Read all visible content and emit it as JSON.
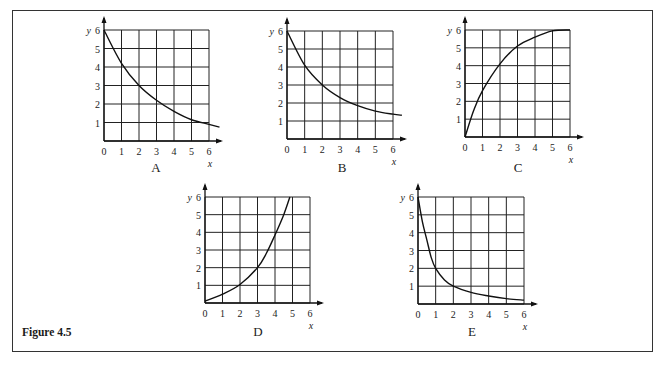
{
  "figure": {
    "caption": "Figure 4.5"
  },
  "chart_data": [
    {
      "type": "line",
      "panel_label": "A",
      "xlabel": "x",
      "ylabel": "y",
      "xlim": [
        0,
        6
      ],
      "ylim": [
        0,
        6
      ],
      "grid": true,
      "x_ticks": [
        "0",
        "1",
        "2",
        "3",
        "4",
        "5",
        "6"
      ],
      "y_ticks": [
        "1",
        "2",
        "3",
        "4",
        "5",
        "6"
      ],
      "x": [
        0,
        1,
        2,
        3,
        4,
        5,
        6,
        6.6
      ],
      "values": [
        6,
        4.2,
        3.0,
        2.2,
        1.6,
        1.15,
        0.9,
        0.75
      ]
    },
    {
      "type": "line",
      "panel_label": "B",
      "xlabel": "x",
      "ylabel": "y",
      "xlim": [
        0,
        6
      ],
      "ylim": [
        0,
        6
      ],
      "grid": true,
      "x_ticks": [
        "0",
        "1",
        "2",
        "3",
        "4",
        "5",
        "6"
      ],
      "y_ticks": [
        "1",
        "2",
        "3",
        "4",
        "5",
        "6"
      ],
      "x": [
        0,
        1,
        2,
        3,
        4,
        5,
        6,
        6.5
      ],
      "values": [
        6,
        4.1,
        3.0,
        2.3,
        1.85,
        1.55,
        1.38,
        1.32
      ]
    },
    {
      "type": "line",
      "panel_label": "C",
      "xlabel": "x",
      "ylabel": "y",
      "xlim": [
        0,
        6
      ],
      "ylim": [
        0,
        6
      ],
      "grid": true,
      "x_ticks": [
        "0",
        "1",
        "2",
        "3",
        "4",
        "5",
        "6"
      ],
      "y_ticks": [
        "1",
        "2",
        "3",
        "4",
        "5",
        "6"
      ],
      "x": [
        0,
        0.5,
        1,
        2,
        3,
        4,
        5,
        6
      ],
      "values": [
        0,
        1.5,
        2.6,
        4.1,
        5.1,
        5.6,
        5.95,
        6.0
      ]
    },
    {
      "type": "line",
      "panel_label": "D",
      "xlabel": "x",
      "ylabel": "y",
      "xlim": [
        0,
        6
      ],
      "ylim": [
        0,
        6
      ],
      "grid": true,
      "x_ticks": [
        "0",
        "1",
        "2",
        "3",
        "4",
        "5",
        "6"
      ],
      "y_ticks": [
        "1",
        "2",
        "3",
        "4",
        "5",
        "6"
      ],
      "x": [
        0,
        1,
        2,
        3,
        3.5,
        4,
        4.5,
        4.85
      ],
      "values": [
        0.1,
        0.5,
        1.05,
        2.0,
        2.8,
        3.85,
        5.0,
        6.0
      ]
    },
    {
      "type": "line",
      "panel_label": "E",
      "xlabel": "x",
      "ylabel": "y",
      "xlim": [
        0,
        6
      ],
      "ylim": [
        0,
        6
      ],
      "grid": true,
      "x_ticks": [
        "0",
        "1",
        "2",
        "3",
        "4",
        "5",
        "6"
      ],
      "y_ticks": [
        "1",
        "2",
        "3",
        "4",
        "5",
        "6"
      ],
      "x": [
        0,
        0.25,
        0.5,
        0.75,
        1,
        1.5,
        2,
        3,
        4,
        5,
        6
      ],
      "values": [
        6,
        4.6,
        3.6,
        2.6,
        2.0,
        1.35,
        1.0,
        0.65,
        0.45,
        0.3,
        0.22
      ]
    }
  ],
  "layout": {
    "panels": [
      {
        "x0": 104,
        "y0": 141,
        "w": 105,
        "h": 111,
        "label_x": 156,
        "label_y": 172
      },
      {
        "x0": 287,
        "y0": 139,
        "w": 106,
        "h": 108,
        "label_x": 342,
        "label_y": 172
      },
      {
        "x0": 465,
        "y0": 137,
        "w": 105,
        "h": 107,
        "label_x": 518,
        "label_y": 172
      },
      {
        "x0": 205,
        "y0": 303,
        "w": 105,
        "h": 106,
        "label_x": 258,
        "label_y": 336
      },
      {
        "x0": 418,
        "y0": 304,
        "w": 106,
        "h": 107,
        "label_x": 472,
        "label_y": 336
      }
    ]
  }
}
